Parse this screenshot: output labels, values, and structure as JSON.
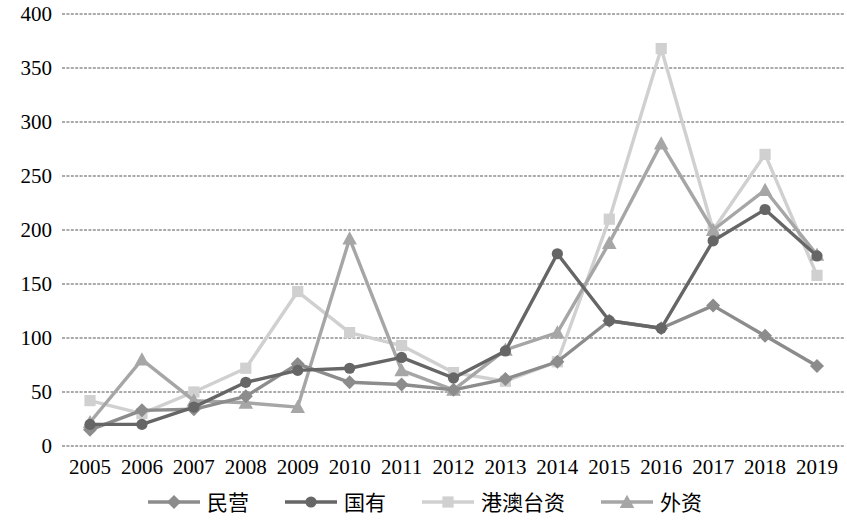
{
  "chart_data": {
    "type": "line",
    "title": "",
    "xlabel": "",
    "ylabel": "",
    "grid": true,
    "legend_position": "bottom",
    "ylim": [
      0,
      400
    ],
    "yticks": [
      "0",
      "50",
      "100",
      "150",
      "200",
      "250",
      "300",
      "350",
      "400"
    ],
    "categories": [
      "2005",
      "2006",
      "2007",
      "2008",
      "2009",
      "2010",
      "2011",
      "2012",
      "2013",
      "2014",
      "2015",
      "2016",
      "2017",
      "2018",
      "2019"
    ],
    "series": [
      {
        "name": "民营",
        "marker": "diamond",
        "color": "#8c8c8c",
        "values": [
          15,
          33,
          34,
          46,
          76,
          59,
          57,
          52,
          62,
          78,
          116,
          109,
          130,
          102,
          74
        ]
      },
      {
        "name": "国有",
        "marker": "circle",
        "color": "#666666",
        "values": [
          20,
          20,
          36,
          59,
          70,
          72,
          82,
          63,
          88,
          178,
          116,
          109,
          190,
          219,
          176
        ]
      },
      {
        "name": "港澳台资",
        "marker": "square",
        "color": "#d0d0d0",
        "values": [
          42,
          30,
          50,
          72,
          143,
          105,
          93,
          68,
          60,
          78,
          210,
          368,
          200,
          270,
          158
        ]
      },
      {
        "name": "外资",
        "marker": "triangle",
        "color": "#a6a6a6",
        "values": [
          22,
          80,
          42,
          40,
          36,
          192,
          70,
          52,
          89,
          105,
          188,
          280,
          200,
          237,
          177
        ]
      }
    ]
  },
  "legend": {
    "items": [
      {
        "label": "民营",
        "marker": "diamond-marker"
      },
      {
        "label": "国有",
        "marker": "circle-marker"
      },
      {
        "label": "港澳台资",
        "marker": "square-marker"
      },
      {
        "label": "外资",
        "marker": "triangle-marker"
      }
    ]
  }
}
